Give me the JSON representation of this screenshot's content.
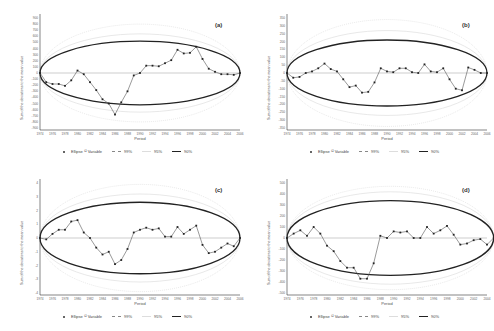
{
  "legend": {
    "variable": "Ellipse ¹² Variable",
    "p99": "99%",
    "p95": "95%",
    "p90": "90%"
  },
  "common": {
    "xlabel": "Period",
    "ylabel": "Sum of the deviations to the mean value"
  },
  "colors": {
    "series": "#555555",
    "marker": "#222222",
    "ellipse90": "#222222",
    "ellipse95": "#d8d8d8",
    "ellipse99": "#bbbbbb",
    "axis": "#333333",
    "zero": "#999999"
  },
  "chart_data": [
    {
      "id": "a",
      "label": "(a)",
      "type": "line",
      "title": "",
      "xlabel": "Period",
      "ylabel": "Sum of the deviations to the mean value",
      "x_ticks": [
        "1974",
        "1976",
        "1978",
        "1980",
        "1982",
        "1984",
        "1986",
        "1988",
        "1990",
        "1992",
        "1994",
        "1996",
        "1998",
        "2000",
        "2002",
        "2004",
        "2006"
      ],
      "y_ticks": [
        900,
        800,
        700,
        600,
        500,
        400,
        300,
        200,
        100,
        0,
        -100,
        -200,
        -300,
        -400,
        -500,
        -600,
        -700,
        -800,
        -900
      ],
      "ylim": [
        -900,
        900
      ],
      "x": [
        1974,
        1975,
        1976,
        1977,
        1978,
        1979,
        1980,
        1981,
        1982,
        1983,
        1984,
        1985,
        1986,
        1987,
        1988,
        1989,
        1990,
        1991,
        1992,
        1993,
        1994,
        1995,
        1996,
        1997,
        1998,
        1999,
        2000,
        2001,
        2002,
        2003,
        2004,
        2005,
        2006
      ],
      "series": [
        {
          "name": "Variable",
          "values": [
            0,
            -150,
            -180,
            -180,
            -210,
            -120,
            40,
            -20,
            -150,
            -280,
            -430,
            -500,
            -680,
            -480,
            -300,
            -40,
            0,
            120,
            120,
            110,
            160,
            210,
            380,
            320,
            330,
            430,
            230,
            70,
            20,
            -20,
            -20,
            -30,
            0
          ]
        }
      ],
      "ellipse": {
        "p90": 520,
        "p95": 640,
        "p99": 800
      }
    },
    {
      "id": "b",
      "label": "(b)",
      "type": "line",
      "title": "",
      "xlabel": "Period",
      "ylabel": "Sum of the deviations to the mean value",
      "x_ticks": [
        "1974",
        "1976",
        "1978",
        "1980",
        "1982",
        "1984",
        "1986",
        "1988",
        "1990",
        "1992",
        "1994",
        "1996",
        "1998",
        "2000",
        "2002",
        "2004",
        "2006"
      ],
      "y_ticks": [
        350,
        300,
        250,
        200,
        150,
        100,
        50,
        0,
        -50,
        -100,
        -150,
        -200,
        -250,
        -300,
        -350
      ],
      "ylim": [
        -350,
        350
      ],
      "x": [
        1974,
        1975,
        1976,
        1977,
        1978,
        1979,
        1980,
        1981,
        1982,
        1983,
        1984,
        1985,
        1986,
        1987,
        1988,
        1989,
        1990,
        1991,
        1992,
        1993,
        1994,
        1995,
        1996,
        1997,
        1998,
        1999,
        2000,
        2001,
        2002,
        2003,
        2004,
        2005,
        2006
      ],
      "series": [
        {
          "name": "Variable",
          "values": [
            0,
            -30,
            -25,
            0,
            10,
            30,
            60,
            25,
            10,
            -40,
            -90,
            -80,
            -125,
            -120,
            -60,
            30,
            10,
            5,
            30,
            30,
            5,
            0,
            55,
            10,
            5,
            30,
            -40,
            -100,
            -110,
            35,
            20,
            0,
            0
          ]
        }
      ],
      "ellipse": {
        "p90": 210,
        "p95": 270,
        "p99": 340
      }
    },
    {
      "id": "c",
      "label": "(c)",
      "type": "line",
      "title": "",
      "xlabel": "Period",
      "ylabel": "Sum of the deviations to the mean value",
      "x_ticks": [
        "1974",
        "1976",
        "1978",
        "1980",
        "1982",
        "1984",
        "1986",
        "1988",
        "1990",
        "1992",
        "1994",
        "1996",
        "1998",
        "2000",
        "2002",
        "2004",
        "2006"
      ],
      "y_ticks": [
        4,
        3,
        2,
        1,
        0,
        -1,
        -2,
        -3,
        -4
      ],
      "ylim": [
        -4,
        4
      ],
      "x": [
        1974,
        1975,
        1976,
        1977,
        1978,
        1979,
        1980,
        1981,
        1982,
        1983,
        1984,
        1985,
        1986,
        1987,
        1988,
        1989,
        1990,
        1991,
        1992,
        1993,
        1994,
        1995,
        1996,
        1997,
        1998,
        1999,
        2000,
        2001,
        2002,
        2003,
        2004,
        2005,
        2006
      ],
      "series": [
        {
          "name": "Variable",
          "values": [
            0,
            -0.1,
            0.3,
            0.6,
            0.6,
            1.2,
            1.3,
            0.4,
            0.0,
            -0.7,
            -1.2,
            -1.0,
            -1.9,
            -1.6,
            -0.8,
            0.4,
            0.6,
            0.75,
            0.6,
            0.7,
            0.1,
            0.1,
            0.8,
            0.3,
            0.6,
            0.9,
            -0.5,
            -1.1,
            -1.0,
            -0.7,
            -0.4,
            -0.6,
            0
          ]
        }
      ],
      "ellipse": {
        "p90": 2.6,
        "p95": 3.2,
        "p99": 3.9
      }
    },
    {
      "id": "d",
      "label": "(d)",
      "type": "line",
      "title": "",
      "xlabel": "Period",
      "ylabel": "Sum of the deviations to the mean value",
      "x_ticks": [
        "1974",
        "1976",
        "1978",
        "1980",
        "1982",
        "1984",
        "1986",
        "1988",
        "1990",
        "1992",
        "1994",
        "1996",
        "1998",
        "2000",
        "2002",
        "2004"
      ],
      "y_ticks": [
        500,
        400,
        300,
        200,
        100,
        0,
        -100,
        -200,
        -300,
        -400,
        -500
      ],
      "ylim": [
        -500,
        500
      ],
      "x": [
        1974,
        1975,
        1976,
        1977,
        1978,
        1979,
        1980,
        1981,
        1982,
        1983,
        1984,
        1985,
        1986,
        1987,
        1988,
        1989,
        1990,
        1991,
        1992,
        1993,
        1994,
        1995,
        1996,
        1997,
        1998,
        1999,
        2000,
        2001,
        2002,
        2003,
        2004,
        2005
      ],
      "series": [
        {
          "name": "Variable",
          "values": [
            0,
            40,
            70,
            20,
            100,
            40,
            -70,
            -120,
            -210,
            -270,
            -270,
            -370,
            -370,
            -230,
            20,
            0,
            60,
            50,
            60,
            0,
            0,
            100,
            40,
            70,
            110,
            30,
            -60,
            -50,
            -20,
            -10,
            -60,
            0
          ]
        }
      ],
      "ellipse": {
        "p90": 340,
        "p95": 420,
        "p99": 470
      }
    }
  ]
}
